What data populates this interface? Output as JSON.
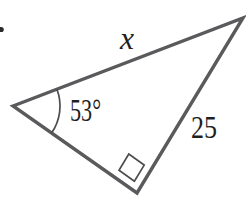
{
  "figure": {
    "type": "triangle-geometry-diagram",
    "labels": {
      "side_top": "x",
      "side_right": "25",
      "angle_left": "53°"
    },
    "markers": {
      "angle_arc": "angle-arc-at-left-vertex",
      "right_angle": "right-angle-square-at-bottom-vertex",
      "list_dot": "list-marker-dot-left-edge"
    },
    "colors": {
      "line": "#5a5a5d",
      "detail": "#4d4d50",
      "text": "#1f1f1f",
      "background": "#ffffff"
    }
  }
}
